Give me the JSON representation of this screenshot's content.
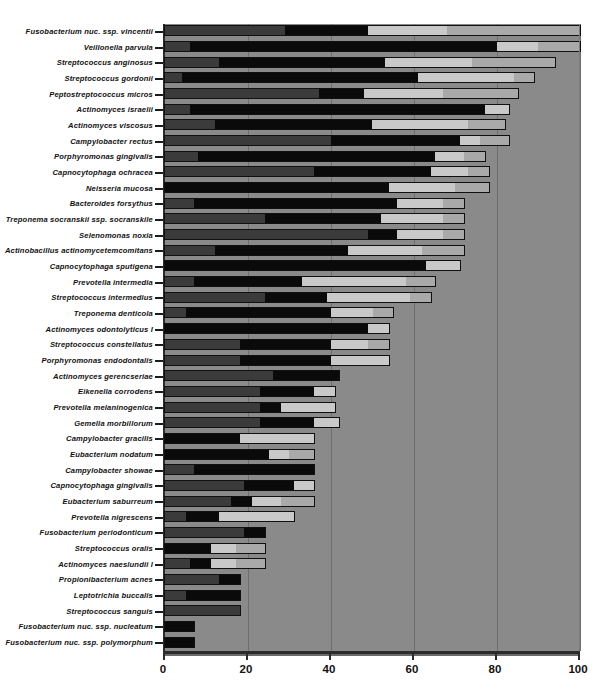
{
  "chart_data": {
    "type": "bar",
    "orientation": "horizontal",
    "stacked": true,
    "title": "",
    "xlabel": "",
    "ylabel": "",
    "xlim": [
      0,
      100
    ],
    "xticks": [
      0,
      20,
      40,
      60,
      80,
      100
    ],
    "xticklabels": [
      "0",
      "20",
      "40",
      "60",
      "80",
      "100"
    ],
    "grid": "vertical",
    "legend": "none",
    "plot_background": "#8a8a8a",
    "series": [
      {
        "name": "segment-1",
        "color": "#3b3b3b"
      },
      {
        "name": "segment-2",
        "color": "#0a0a0a"
      },
      {
        "name": "segment-3",
        "color": "#c9c9c9"
      },
      {
        "name": "segment-4",
        "color": "#a9a9a9"
      }
    ],
    "categories": [
      "Fusobacterium nuc. ssp. vincentii",
      "Veillonella parvula",
      "Streptococcus anginosus",
      "Streptococcus gordonii",
      "Peptostreptococcus micros",
      "Actinomyces israelii",
      "Actinomyces viscosus",
      "Campylobacter rectus",
      "Porphyromonas gingivalis",
      "Capnocytophaga ochracea",
      "Neisseria mucosa",
      "Bacteroides forsythus",
      "Treponema socranskii ssp. socranskile",
      "Selenomonas noxia",
      "Actinobacillus actinomycetemcomitans",
      "Capnocytophaga sputigena",
      "Prevotella intermedia",
      "Streptococcus intermedius",
      "Treponema denticola",
      "Actinomyces odontolyticus I",
      "Streptococcus constellatus",
      "Porphyromonas endodontalis",
      "Actinomyces gerencseriae",
      "Eikenella corrodens",
      "Prevotella melaninogenica",
      "Gemella morbillorum",
      "Campylobacter gracilis",
      "Eubacterium nodatum",
      "Campylobacter showae",
      "Capnocytophaga gingivalis",
      "Eubacterium saburreum",
      "Prevotella nigrescens",
      "Fusobacterium periodonticum",
      "Streptococcus oralis",
      "Actinomyces naeslundii I",
      "Propionibacterium acnes",
      "Leptotrichia buccalis",
      "Streptococcus sanguis",
      "Fusobacterium nuc. ssp. nucleatum",
      "Fusobacterium nuc. ssp. polymorphum"
    ],
    "totals": [
      100,
      100,
      94,
      89,
      85,
      83,
      82,
      83,
      77,
      78,
      78,
      72,
      72,
      72,
      72,
      71,
      65,
      64,
      55,
      54,
      54,
      54,
      42,
      41,
      41,
      42,
      36,
      36,
      36,
      36,
      36,
      31,
      24,
      24,
      24,
      18,
      18,
      18,
      7,
      7
    ],
    "stacks": [
      {
        "label": "Fusobacterium nuc. ssp. vincentii",
        "values": [
          29,
          20,
          19,
          32
        ],
        "total": 100
      },
      {
        "label": "Veillonella parvula",
        "values": [
          6,
          74,
          10,
          10
        ],
        "total": 100
      },
      {
        "label": "Streptococcus anginosus",
        "values": [
          13,
          40,
          21,
          20
        ],
        "total": 94
      },
      {
        "label": "Streptococcus gordonii",
        "values": [
          4,
          57,
          23,
          5
        ],
        "total": 89
      },
      {
        "label": "Peptostreptococcus micros",
        "values": [
          37,
          11,
          19,
          18
        ],
        "total": 85
      },
      {
        "label": "Actinomyces israelii",
        "values": [
          6,
          71,
          6,
          0
        ],
        "total": 83
      },
      {
        "label": "Actinomyces viscosus",
        "values": [
          12,
          38,
          23,
          9
        ],
        "total": 82
      },
      {
        "label": "Campylobacter rectus",
        "values": [
          40,
          31,
          5,
          7
        ],
        "total": 83
      },
      {
        "label": "Porphyromonas gingivalis",
        "values": [
          8,
          57,
          7,
          5
        ],
        "total": 77
      },
      {
        "label": "Capnocytophaga ochracea",
        "values": [
          36,
          28,
          9,
          5
        ],
        "total": 78
      },
      {
        "label": "Neisseria mucosa",
        "values": [
          0,
          54,
          16,
          8
        ],
        "total": 78
      },
      {
        "label": "Bacteroides forsythus",
        "values": [
          7,
          49,
          11,
          5
        ],
        "total": 72
      },
      {
        "label": "Treponema socranskii ssp. socranskile",
        "values": [
          24,
          28,
          15,
          5
        ],
        "total": 72
      },
      {
        "label": "Selenomonas noxia",
        "values": [
          49,
          7,
          11,
          5
        ],
        "total": 72
      },
      {
        "label": "Actinobacillus actinomycetemcomitans",
        "values": [
          12,
          32,
          18,
          10
        ],
        "total": 72
      },
      {
        "label": "Capnocytophaga sputigena",
        "values": [
          0,
          63,
          8,
          0
        ],
        "total": 71
      },
      {
        "label": "Prevotella intermedia",
        "values": [
          7,
          26,
          25,
          7
        ],
        "total": 65
      },
      {
        "label": "Streptococcus intermedius",
        "values": [
          24,
          15,
          20,
          5
        ],
        "total": 64
      },
      {
        "label": "Treponema denticola",
        "values": [
          5,
          35,
          10,
          5
        ],
        "total": 55
      },
      {
        "label": "Actinomyces odontolyticus I",
        "values": [
          0,
          49,
          5,
          0
        ],
        "total": 54
      },
      {
        "label": "Streptococcus constellatus",
        "values": [
          18,
          22,
          9,
          5
        ],
        "total": 54
      },
      {
        "label": "Porphyromonas endodontalis",
        "values": [
          18,
          22,
          14,
          0
        ],
        "total": 54
      },
      {
        "label": "Actinomyces gerencseriae",
        "values": [
          26,
          16,
          0,
          0
        ],
        "total": 42
      },
      {
        "label": "Eikenella corrodens",
        "values": [
          23,
          13,
          5,
          0
        ],
        "total": 41
      },
      {
        "label": "Prevotella melaninogenica",
        "values": [
          23,
          5,
          13,
          0
        ],
        "total": 41
      },
      {
        "label": "Gemella morbillorum",
        "values": [
          23,
          13,
          6,
          0
        ],
        "total": 42
      },
      {
        "label": "Campylobacter gracilis",
        "values": [
          0,
          18,
          18,
          0
        ],
        "total": 36
      },
      {
        "label": "Eubacterium nodatum",
        "values": [
          0,
          25,
          5,
          6
        ],
        "total": 36
      },
      {
        "label": "Campylobacter showae",
        "values": [
          7,
          29,
          0,
          0
        ],
        "total": 36
      },
      {
        "label": "Capnocytophaga gingivalis",
        "values": [
          19,
          12,
          5,
          0
        ],
        "total": 36
      },
      {
        "label": "Eubacterium saburreum",
        "values": [
          16,
          5,
          7,
          8
        ],
        "total": 36
      },
      {
        "label": "Prevotella nigrescens",
        "values": [
          5,
          8,
          18,
          0
        ],
        "total": 31
      },
      {
        "label": "Fusobacterium periodonticum",
        "values": [
          19,
          5,
          0,
          0
        ],
        "total": 24
      },
      {
        "label": "Streptococcus oralis",
        "values": [
          0,
          11,
          6,
          7
        ],
        "total": 24
      },
      {
        "label": "Actinomyces naeslundii I",
        "values": [
          6,
          5,
          6,
          7
        ],
        "total": 24
      },
      {
        "label": "Propionibacterium acnes",
        "values": [
          13,
          5,
          0,
          0
        ],
        "total": 18
      },
      {
        "label": "Leptotrichia buccalis",
        "values": [
          5,
          13,
          0,
          0
        ],
        "total": 18
      },
      {
        "label": "Streptococcus sanguis",
        "values": [
          18,
          0,
          0,
          0
        ],
        "total": 18
      },
      {
        "label": "Fusobacterium nuc. ssp. nucleatum",
        "values": [
          0,
          7,
          0,
          0
        ],
        "total": 7
      },
      {
        "label": "Fusobacterium nuc. ssp. polymorphum",
        "values": [
          0,
          7,
          0,
          0
        ],
        "total": 7
      }
    ]
  }
}
